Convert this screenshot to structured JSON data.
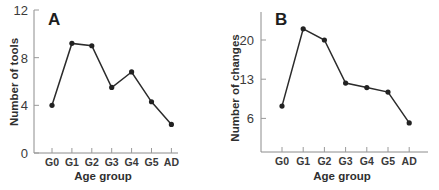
{
  "chart_data": [
    {
      "type": "line",
      "panel": "A",
      "title": "",
      "xlabel": "Age group",
      "ylabel": "Number of tools",
      "categories": [
        "G0",
        "G1",
        "G2",
        "G3",
        "G4",
        "G5",
        "AD"
      ],
      "values": [
        4.0,
        9.2,
        9.0,
        5.5,
        6.8,
        4.3,
        2.4
      ],
      "yticks": [
        0,
        4,
        8,
        12
      ],
      "ytick_labels": [
        "0",
        "4",
        "8",
        "12"
      ],
      "ylim": [
        0,
        12
      ],
      "grid": false,
      "legend": null,
      "markers": true
    },
    {
      "type": "line",
      "panel": "B",
      "title": "",
      "xlabel": "Age group",
      "ylabel": "Number of changes",
      "categories": [
        "G0",
        "G1",
        "G2",
        "G3",
        "G4",
        "G5",
        "AD"
      ],
      "values": [
        8.2,
        22.0,
        20.0,
        12.3,
        11.5,
        10.7,
        5.2
      ],
      "yticks": [
        6,
        13,
        20
      ],
      "ytick_labels": [
        "6",
        "13",
        "20"
      ],
      "ylim": [
        0,
        25
      ],
      "grid": false,
      "legend": null,
      "markers": true
    }
  ],
  "panels": {
    "a": {
      "letter": "A",
      "xlabel": "Age group",
      "ylabel": "Number of tools"
    },
    "b": {
      "letter": "B",
      "xlabel": "Age group",
      "ylabel": "Number of changes"
    }
  }
}
